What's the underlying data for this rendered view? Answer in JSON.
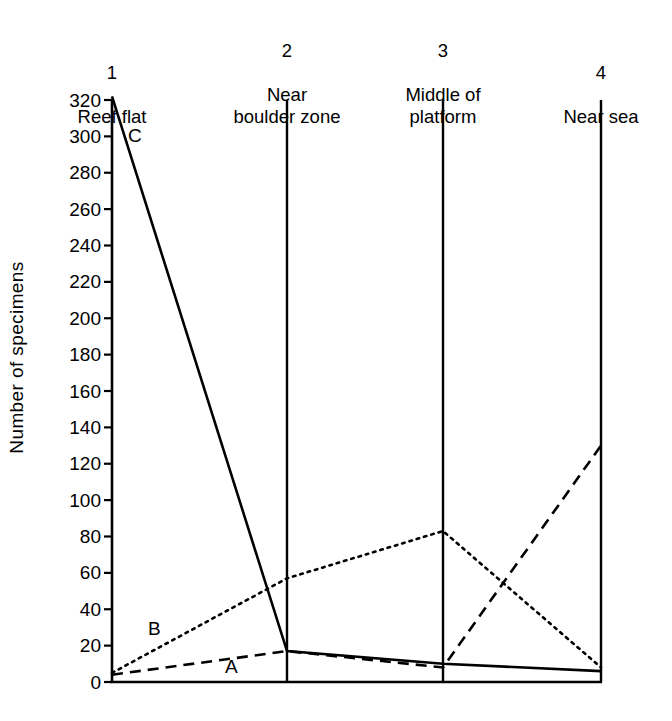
{
  "chart_data": {
    "type": "line",
    "title": "",
    "xlabel": "",
    "ylabel": "Number  of  specimens",
    "ylim": [
      0,
      320
    ],
    "ytick_values": [
      0,
      20,
      40,
      60,
      80,
      100,
      120,
      140,
      160,
      180,
      200,
      220,
      240,
      260,
      280,
      300,
      320
    ],
    "ytick_labels": [
      "0",
      "20",
      "40",
      "60",
      "80",
      "100",
      "120",
      "140",
      "160",
      "180",
      "200",
      "220",
      "240",
      "260",
      "280",
      "300",
      "320"
    ],
    "grid": false,
    "legend_position": "inline-annotations",
    "categories": [
      "1",
      "2",
      "3",
      "4"
    ],
    "category_labels": [
      {
        "number": "1",
        "name": "Reef flat"
      },
      {
        "number": "2",
        "name": "Near\nboulder zone"
      },
      {
        "number": "3",
        "name": "Middle of\nplatform"
      },
      {
        "number": "4",
        "name": "Near sea"
      }
    ],
    "series": [
      {
        "name": "A",
        "style": "dashed",
        "values": [
          4,
          17,
          8,
          130
        ]
      },
      {
        "name": "B",
        "style": "dotted",
        "values": [
          5,
          57,
          83,
          8
        ]
      },
      {
        "name": "C",
        "style": "solid",
        "values": [
          322,
          17,
          10,
          6
        ]
      }
    ],
    "annotations": [
      {
        "label": "A",
        "x": 225,
        "y": 657
      },
      {
        "label": "B",
        "x": 148,
        "y": 619
      },
      {
        "label": "C",
        "x": 128,
        "y": 126
      }
    ],
    "colors": {
      "ink": "#000000",
      "background": "#ffffff"
    }
  }
}
